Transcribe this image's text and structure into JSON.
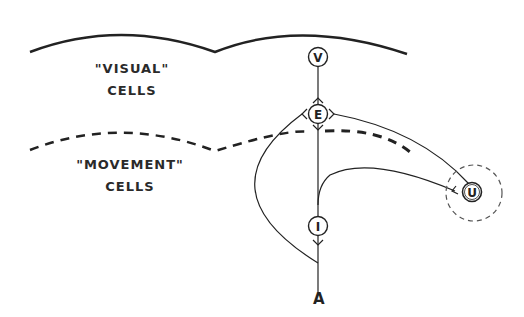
{
  "regions": {
    "visual": {
      "line1": "\"VISUAL\"",
      "line2": "CELLS"
    },
    "movement": {
      "line1": "\"MOVEMENT\"",
      "line2": "CELLS"
    }
  },
  "nodes": {
    "v": {
      "label": "V"
    },
    "e": {
      "label": "E"
    },
    "i": {
      "label": "I"
    },
    "u": {
      "label": "U"
    }
  },
  "output": {
    "label": "A"
  },
  "colors": {
    "ink": "#222222",
    "background": "#ffffff"
  }
}
